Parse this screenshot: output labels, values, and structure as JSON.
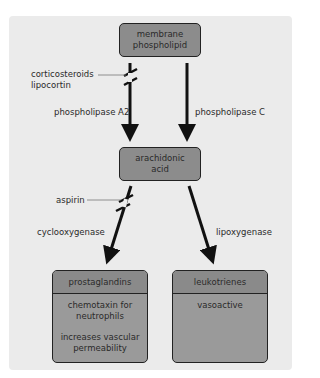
{
  "diagram": {
    "nodes": {
      "membrane": {
        "line1": "membrane",
        "line2": "phospholipid"
      },
      "arachidonic": {
        "line1": "arachidonic",
        "line2": "acid"
      },
      "prostaglandins": {
        "title": "prostaglandins",
        "effects": [
          {
            "line1": "chemotaxin for",
            "line2": "neutrophils"
          },
          {
            "line1": "increases vascular",
            "line2": "permeability"
          }
        ]
      },
      "leukotrienes": {
        "title": "leukotrienes",
        "effects": [
          {
            "line1": "vasoactive"
          }
        ]
      }
    },
    "edges": {
      "pla2": "phospholipase A2",
      "plc": "phospholipase C",
      "cox": "cyclooxygenase",
      "lox": "lipoxygenase"
    },
    "inhibitors": {
      "pla2_inhibitor": {
        "line1": "corticosteroids",
        "line2": "lipocortin"
      },
      "cox_inhibitor": "aspirin"
    },
    "colors": {
      "panel": "#ebebeb",
      "box": "#8c8c8c",
      "box_header": "#8a8a8a",
      "box_body": "#9a9a9a",
      "arrow": "#111111",
      "text": "#2a2a2a"
    }
  }
}
